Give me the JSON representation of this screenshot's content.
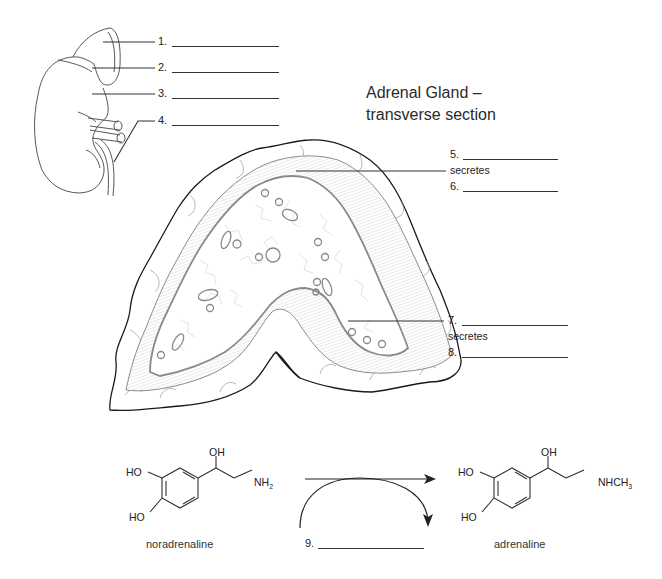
{
  "title": {
    "line1": "Adrenal Gland –",
    "line2": "transverse section"
  },
  "kidney_labels": [
    {
      "num": "1."
    },
    {
      "num": "2."
    },
    {
      "num": "3."
    },
    {
      "num": "4."
    }
  ],
  "gland_labels": {
    "upper": {
      "num_a": "5.",
      "secretes": "secretes",
      "num_b": "6."
    },
    "lower": {
      "num_a": "7.",
      "secretes": "secretes",
      "num_b": "8."
    }
  },
  "reaction": {
    "reactant": {
      "name": "noradrenaline",
      "groups": {
        "oh_top": "OH",
        "ho_upper": "HO",
        "ho_lower": "HO",
        "amine": "NH",
        "amine_sub": "2"
      }
    },
    "product": {
      "name": "adrenaline",
      "groups": {
        "oh_top": "OH",
        "ho_upper": "HO",
        "ho_lower": "HO",
        "amine": "NHCH",
        "amine_sub": "3"
      }
    },
    "enzyme_label": {
      "num": "9."
    }
  },
  "colors": {
    "line": "#333333",
    "tissue": "#9a9a9a",
    "outline": "#1a1a1a"
  }
}
